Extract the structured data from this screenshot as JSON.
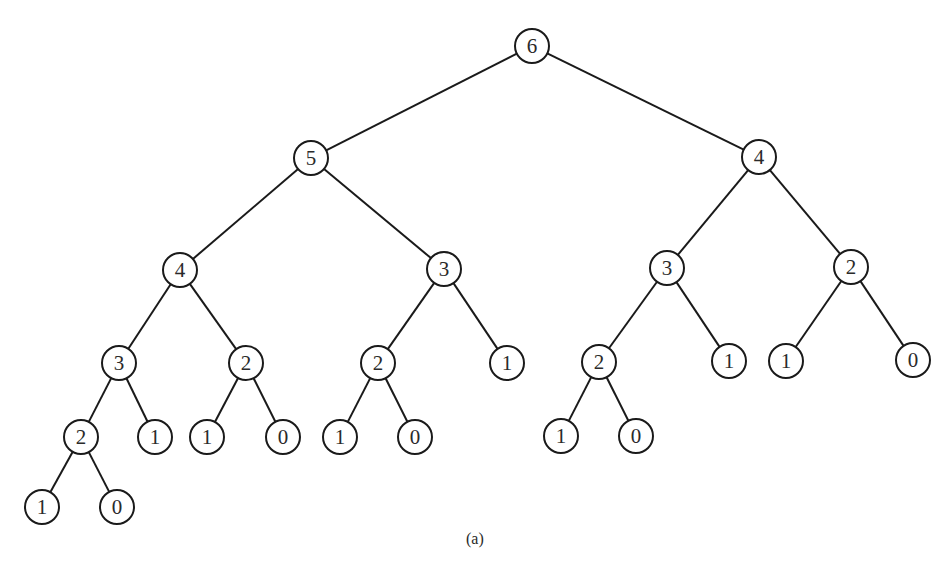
{
  "diagram": {
    "type": "binary-tree",
    "caption": "(a)",
    "node_radius": 17,
    "nodes": [
      {
        "id": "n0",
        "label": "6",
        "x": 532,
        "y": 46
      },
      {
        "id": "n1",
        "label": "5",
        "x": 311,
        "y": 158
      },
      {
        "id": "n2",
        "label": "4",
        "x": 759,
        "y": 157
      },
      {
        "id": "n3",
        "label": "4",
        "x": 180,
        "y": 270
      },
      {
        "id": "n4",
        "label": "3",
        "x": 444,
        "y": 269
      },
      {
        "id": "n5",
        "label": "3",
        "x": 667,
        "y": 268
      },
      {
        "id": "n6",
        "label": "2",
        "x": 851,
        "y": 267
      },
      {
        "id": "n7",
        "label": "3",
        "x": 119,
        "y": 363
      },
      {
        "id": "n8",
        "label": "2",
        "x": 246,
        "y": 363
      },
      {
        "id": "n9",
        "label": "2",
        "x": 378,
        "y": 363
      },
      {
        "id": "n10",
        "label": "1",
        "x": 507,
        "y": 363
      },
      {
        "id": "n11",
        "label": "2",
        "x": 599,
        "y": 362
      },
      {
        "id": "n12",
        "label": "1",
        "x": 729,
        "y": 361
      },
      {
        "id": "n13",
        "label": "1",
        "x": 786,
        "y": 361
      },
      {
        "id": "n14",
        "label": "0",
        "x": 913,
        "y": 360
      },
      {
        "id": "n15",
        "label": "2",
        "x": 81,
        "y": 437
      },
      {
        "id": "n16",
        "label": "1",
        "x": 155,
        "y": 437
      },
      {
        "id": "n17",
        "label": "1",
        "x": 207,
        "y": 437
      },
      {
        "id": "n18",
        "label": "0",
        "x": 283,
        "y": 437
      },
      {
        "id": "n19",
        "label": "1",
        "x": 340,
        "y": 437
      },
      {
        "id": "n20",
        "label": "0",
        "x": 415,
        "y": 437
      },
      {
        "id": "n21",
        "label": "1",
        "x": 561,
        "y": 436
      },
      {
        "id": "n22",
        "label": "0",
        "x": 636,
        "y": 436
      },
      {
        "id": "n23",
        "label": "1",
        "x": 42,
        "y": 507
      },
      {
        "id": "n24",
        "label": "0",
        "x": 117,
        "y": 507
      }
    ],
    "edges": [
      [
        "n0",
        "n1"
      ],
      [
        "n0",
        "n2"
      ],
      [
        "n1",
        "n3"
      ],
      [
        "n1",
        "n4"
      ],
      [
        "n2",
        "n5"
      ],
      [
        "n2",
        "n6"
      ],
      [
        "n3",
        "n7"
      ],
      [
        "n3",
        "n8"
      ],
      [
        "n4",
        "n9"
      ],
      [
        "n4",
        "n10"
      ],
      [
        "n5",
        "n11"
      ],
      [
        "n5",
        "n12"
      ],
      [
        "n6",
        "n13"
      ],
      [
        "n6",
        "n14"
      ],
      [
        "n7",
        "n15"
      ],
      [
        "n7",
        "n16"
      ],
      [
        "n8",
        "n17"
      ],
      [
        "n8",
        "n18"
      ],
      [
        "n9",
        "n19"
      ],
      [
        "n9",
        "n20"
      ],
      [
        "n11",
        "n21"
      ],
      [
        "n11",
        "n22"
      ],
      [
        "n15",
        "n23"
      ],
      [
        "n15",
        "n24"
      ]
    ]
  },
  "colors": {
    "stroke": "#1a1a1a",
    "text": "#2a2a2a",
    "background": "#ffffff"
  }
}
